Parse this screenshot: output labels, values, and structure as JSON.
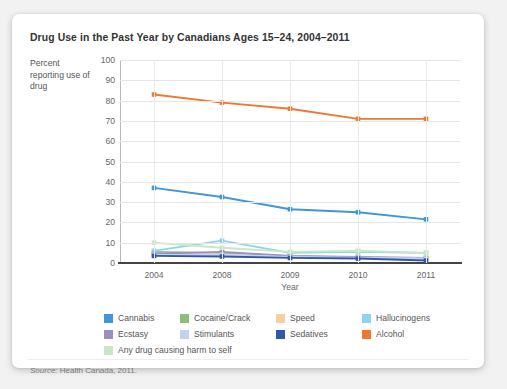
{
  "card": {
    "title": "Drug Use in the Past Year by Canadians Ages 15–24, 2004–2011",
    "source_prefix": "Source:",
    "source_text": " Health Canada, 2011."
  },
  "chart_data": {
    "type": "line",
    "title": "Drug Use in the Past Year by Canadians Ages 15–24, 2004–2011",
    "xlabel": "Year",
    "ylabel": "Percent reporting use of drug",
    "categories": [
      "2004",
      "2008",
      "2009",
      "2010",
      "2011"
    ],
    "ylim": [
      0,
      100
    ],
    "yticks": [
      "0",
      "10",
      "20",
      "30",
      "40",
      "50",
      "60",
      "70",
      "80",
      "90",
      "100"
    ],
    "grid": true,
    "legend_position": "bottom",
    "series": [
      {
        "name": "Cannabis",
        "color": "#3f96d8",
        "values": [
          37.0,
          32.5,
          26.5,
          25.0,
          21.5
        ]
      },
      {
        "name": "Cocaine/Crack",
        "color": "#8cc07a",
        "values": [
          5.5,
          5.0,
          3.3,
          2.7,
          2.3
        ]
      },
      {
        "name": "Speed",
        "color": "#f8cf9c",
        "values": [
          4.5,
          4.2,
          3.0,
          2.5,
          2.2
        ]
      },
      {
        "name": "Hallucinogens",
        "color": "#8ed3ef",
        "values": [
          6.0,
          11.0,
          5.0,
          5.5,
          5.0
        ]
      },
      {
        "name": "Ecstasy",
        "color": "#9b8ec4",
        "values": [
          4.5,
          5.5,
          3.5,
          3.0,
          2.5
        ]
      },
      {
        "name": "Stimulants",
        "color": "#c3d3ef",
        "values": [
          4.0,
          4.0,
          3.0,
          2.6,
          2.2
        ]
      },
      {
        "name": "Sedatives",
        "color": "#3158a8",
        "values": [
          3.5,
          3.2,
          2.5,
          2.2,
          1.2
        ]
      },
      {
        "name": "Alcohol",
        "color": "#ee7733",
        "values": [
          83.0,
          79.0,
          76.0,
          71.0,
          71.0
        ]
      },
      {
        "name": "Any drug causing harm to self",
        "color": "#c6e8c6",
        "values": [
          10.0,
          7.5,
          5.5,
          6.0,
          5.0
        ]
      }
    ]
  },
  "legend": {
    "rows": [
      [
        {
          "label": "Cannabis",
          "color": "#3f96d8"
        },
        {
          "label": "Cocaine/Crack",
          "color": "#8cc07a"
        },
        {
          "label": "Speed",
          "color": "#f8cf9c"
        },
        {
          "label": "Hallucinogens",
          "color": "#8ed3ef"
        }
      ],
      [
        {
          "label": "Ecstasy",
          "color": "#9b8ec4"
        },
        {
          "label": "Stimulants",
          "color": "#c3d3ef"
        },
        {
          "label": "Sedatives",
          "color": "#3158a8"
        },
        {
          "label": "Alcohol",
          "color": "#ee7733"
        }
      ],
      [
        {
          "label": "Any drug causing harm to self",
          "color": "#c6e8c6"
        }
      ]
    ]
  }
}
